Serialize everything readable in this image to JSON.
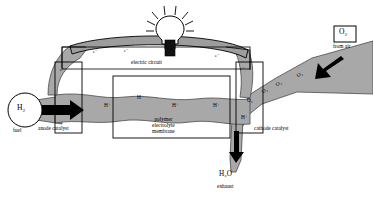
{
  "diagram": {
    "colors": {
      "stream_fill": "#a8a8a8",
      "stream_stroke": "#4a4a4a",
      "circuit_fill": "#9d9d9d",
      "outline": "#000000",
      "background": "#ffffff",
      "arrow": "#000000"
    }
  },
  "inputs": {
    "fuel": {
      "species_label": "H₂",
      "caption": "fuel"
    },
    "oxidant": {
      "species_label": "O₂",
      "caption": "from air"
    }
  },
  "outputs": {
    "exhaust": {
      "species_label": "H₂O",
      "caption": "exhaust"
    }
  },
  "components": {
    "anode_catalyst_label": "anode catalyst",
    "cathode_catalyst_label": "cathode catalyst",
    "membrane_label_lines": [
      "polymer",
      "electrolyte",
      "membrane"
    ],
    "circuit_label": "electric circuit",
    "lamp_name": "light-bulb"
  },
  "carriers": {
    "electron_symbol": "e⁻",
    "proton_symbol": "H⁺",
    "oxygen_symbol": "O₂",
    "electron_markers": [
      {
        "x": 60,
        "y": 68
      },
      {
        "x": 93,
        "y": 50
      },
      {
        "x": 124,
        "y": 49
      },
      {
        "x": 170,
        "y": 47
      },
      {
        "x": 215,
        "y": 54
      },
      {
        "x": 240,
        "y": 67
      }
    ],
    "proton_markers": [
      {
        "x": 104,
        "y": 103
      },
      {
        "x": 137,
        "y": 95
      },
      {
        "x": 172,
        "y": 103
      },
      {
        "x": 213,
        "y": 103
      },
      {
        "x": 241,
        "y": 115
      }
    ],
    "oxygen_markers": [
      {
        "x": 247,
        "y": 98
      },
      {
        "x": 262,
        "y": 88
      },
      {
        "x": 276,
        "y": 81
      },
      {
        "x": 297,
        "y": 72
      }
    ]
  }
}
